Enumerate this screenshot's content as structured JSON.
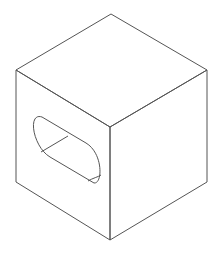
{
  "diagram": {
    "type": "isometric-line-drawing",
    "stroke_color": "#555555",
    "background": "#ffffff",
    "vertices": {
      "top": [
        111,
        14
      ],
      "top_left": [
        16,
        70
      ],
      "top_right": [
        207,
        70
      ],
      "center": [
        110,
        127
      ],
      "bottom_left": [
        16,
        182
      ],
      "bottom_right": [
        207,
        182
      ],
      "bottom": [
        110,
        240
      ]
    }
  }
}
